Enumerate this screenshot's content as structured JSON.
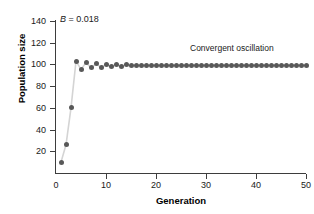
{
  "chart_data": {
    "type": "line",
    "title": "",
    "subtitle": "",
    "xlabel": "Generation",
    "ylabel": "Population size",
    "xlim": [
      0,
      50
    ],
    "ylim": [
      0,
      140
    ],
    "xticks": [
      0,
      10,
      20,
      30,
      40,
      50
    ],
    "yticks": [
      20,
      40,
      60,
      80,
      100,
      120,
      140
    ],
    "grid": false,
    "legend": null,
    "annotations": [
      {
        "name": "parameter-label",
        "symbol": "B",
        "separator": " = ",
        "value": "0.018",
        "text": "B = 0.018",
        "x": 1.2,
        "y": 137
      },
      {
        "name": "behavior-label",
        "text": "Convergent oscillation",
        "x": 27,
        "y": 113
      }
    ],
    "colors": {
      "marker": "#585858",
      "line": "#d4d4d4",
      "axis": "#3d3d3d",
      "text": "#1a1a1a",
      "background": "#ffffff"
    },
    "marker": "circle",
    "marker_size": 5,
    "series": [
      {
        "name": "population",
        "x": [
          1,
          2,
          3,
          4,
          5,
          6,
          7,
          8,
          9,
          10,
          11,
          12,
          13,
          14,
          15,
          16,
          17,
          18,
          19,
          20,
          21,
          22,
          23,
          24,
          25,
          26,
          27,
          28,
          29,
          30,
          31,
          32,
          33,
          34,
          35,
          36,
          37,
          38,
          39,
          40,
          41,
          42,
          43,
          44,
          45,
          46,
          47,
          48,
          49,
          50
        ],
        "values": [
          10,
          26,
          60,
          103,
          95.5,
          101.5,
          97,
          100.5,
          97.5,
          99.8,
          98.2,
          99.6,
          98.5,
          99.5,
          98.7,
          99.4,
          98.9,
          99.3,
          99.0,
          99.3,
          99.0,
          99.2,
          99.0,
          99.2,
          99.1,
          99.2,
          99.1,
          99.2,
          99.1,
          99.2,
          99.1,
          99.2,
          99.1,
          99.2,
          99.1,
          99.2,
          99.1,
          99.2,
          99.1,
          99.2,
          99.1,
          99.2,
          99.1,
          99.2,
          99.1,
          99.2,
          99.1,
          99.2,
          99.1,
          99.2
        ]
      }
    ]
  }
}
